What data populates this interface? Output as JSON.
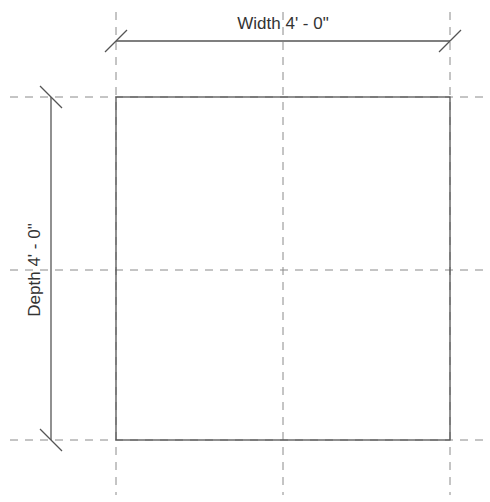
{
  "drawing": {
    "type": "plan-view-dimensioned-rectangle",
    "width_dimension": {
      "label": "Width 4' - 0\""
    },
    "depth_dimension": {
      "label": "Depth 4' - 0\""
    },
    "rectangle": {
      "left": 116,
      "top": 97,
      "right": 450,
      "bottom": 440
    },
    "reference_planes": {
      "vertical_x": [
        116,
        283,
        450
      ],
      "horizontal_y": [
        97,
        270,
        440
      ]
    },
    "colors": {
      "line": "#555555",
      "reference": "#8a8a8a",
      "text": "#333333",
      "background": "#ffffff"
    }
  }
}
